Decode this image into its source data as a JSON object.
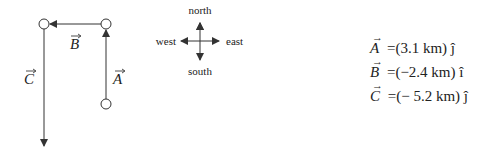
{
  "diagram": {
    "vectors": [
      {
        "name": "A",
        "label": "A",
        "direction": "north",
        "from": [
          106,
          104
        ],
        "to": [
          106,
          24
        ]
      },
      {
        "name": "B",
        "label": "B",
        "direction": "west",
        "from": [
          106,
          24
        ],
        "to": [
          44,
          24
        ]
      },
      {
        "name": "C",
        "label": "C",
        "direction": "south",
        "from": [
          44,
          24
        ],
        "to": [
          44,
          146
        ]
      }
    ],
    "compass": {
      "north": "north",
      "south": "south",
      "east": "east",
      "west": "west"
    },
    "colors": {
      "line": "#333333",
      "text": "#222222"
    }
  },
  "equations": [
    {
      "symbol": "A",
      "equals": "=",
      "value": "(3.1 km)",
      "unit_vector": "ĵ"
    },
    {
      "symbol": "B",
      "equals": "=",
      "value": "(−2.4 km)",
      "unit_vector": "î"
    },
    {
      "symbol": "C",
      "equals": "=",
      "value": "(− 5.2 km)",
      "unit_vector": "ĵ"
    }
  ]
}
